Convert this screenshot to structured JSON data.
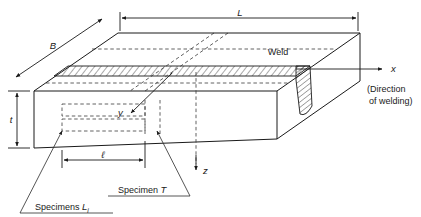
{
  "figure": {
    "type": "technical-isometric-diagram",
    "background_color": "#ffffff",
    "line_color": "#1a1a1a"
  },
  "dimensions": {
    "length_label": "L",
    "breadth_label": "B",
    "thickness_label": "t",
    "specimen_length_label": "ℓ"
  },
  "axes": {
    "x_label": "x",
    "y_label": "y",
    "z_label": "z"
  },
  "annotations": {
    "weld_label": "Weld",
    "direction_line1": "(Direction",
    "direction_line2": "of welding)",
    "specimen_t_label_prefix": "Specimen ",
    "specimen_t_label_symbol": "T",
    "specimens_l_label_prefix": "Specimens ",
    "specimens_l_label_symbol": "L",
    "specimens_l_label_subscript": "i"
  }
}
